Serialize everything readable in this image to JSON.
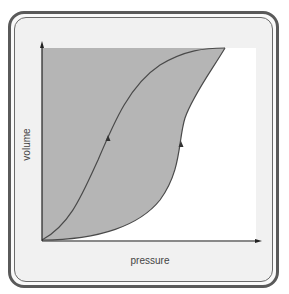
{
  "diagram": {
    "title": "",
    "x_axis_label": "pressure",
    "y_axis_label": "volume",
    "colors": {
      "frame_border": "#5a5a5a",
      "frame_background": "#f1f1f1",
      "plot_background": "#ffffff",
      "hysteresis_fill": "#b5b5b5",
      "curve_stroke": "#4a4a4a",
      "axis_stroke": "#222222"
    },
    "curves": [
      {
        "name": "inflation-curve",
        "direction": "up",
        "description": "S-shaped curve from origin to top-right vertex (left/upper branch)"
      },
      {
        "name": "deflation-curve",
        "direction": "up",
        "description": "Concave curve hugging pressure axis then rising to top-right vertex (right/lower branch)"
      }
    ],
    "shaded_region": "area between y-axis, top of plot and right branch"
  }
}
